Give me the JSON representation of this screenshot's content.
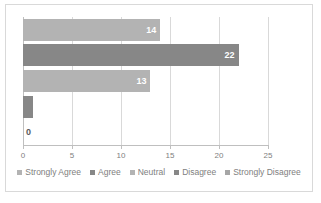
{
  "chart_data": {
    "type": "bar",
    "orientation": "horizontal",
    "title": "",
    "xlabel": "",
    "ylabel": "",
    "xlim": [
      0,
      25
    ],
    "tick_labels": [
      "0",
      "5",
      "10",
      "15",
      "20",
      "25"
    ],
    "tick_values": [
      0,
      5,
      10,
      15,
      20,
      25
    ],
    "grid": true,
    "grid_axis": "x",
    "legend_position": "bottom",
    "categories": [
      "Strongly Agree",
      "Agree",
      "Neutral",
      "Disagree",
      "Strongly Disagree"
    ],
    "values": [
      14,
      22,
      13,
      1,
      0
    ],
    "data_labels": [
      "14",
      "22",
      "13",
      "1",
      "0"
    ],
    "colors": [
      "#b3b3b3",
      "#878787",
      "#b3b3b3",
      "#878787",
      "#b3b3b3"
    ],
    "label_colors": [
      "#ffffff",
      "#ffffff",
      "#ffffff",
      "#ffffff",
      "#595959"
    ],
    "series": [
      {
        "name": "Strongly Agree",
        "value": 14,
        "color": "#b3b3b3"
      },
      {
        "name": "Agree",
        "value": 22,
        "color": "#878787"
      },
      {
        "name": "Neutral",
        "value": 13,
        "color": "#b3b3b3"
      },
      {
        "name": "Disagree",
        "value": 1,
        "color": "#878787"
      },
      {
        "name": "Strongly Disagree",
        "value": 0,
        "color": "#b3b3b3"
      }
    ]
  },
  "legend": {
    "items": [
      {
        "label": "Strongly Agree",
        "color": "#b3b3b3"
      },
      {
        "label": "Agree",
        "color": "#878787"
      },
      {
        "label": "Neutral",
        "color": "#b3b3b3"
      },
      {
        "label": "Disagree",
        "color": "#878787"
      },
      {
        "label": "Strongly Disagree",
        "color": "#a6a6a6"
      }
    ]
  }
}
